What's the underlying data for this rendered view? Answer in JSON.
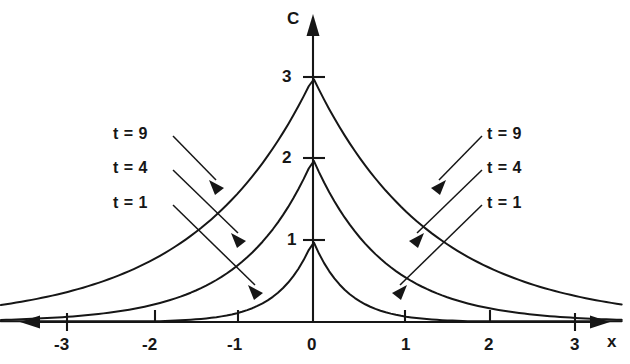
{
  "chart_data": {
    "type": "line",
    "title": "",
    "xlabel": "x",
    "ylabel": "C",
    "xlim": [
      -3.6,
      3.6
    ],
    "ylim": [
      0,
      3.6
    ],
    "grid": false,
    "legend_position": "inline-annotations",
    "x_ticks": [
      -3,
      -2,
      -1,
      0,
      1,
      2,
      3
    ],
    "x_tick_labels": [
      "-3",
      "-2",
      "-1",
      "0",
      "1",
      "2",
      "3"
    ],
    "y_ticks": [
      1,
      2,
      3
    ],
    "y_tick_labels": [
      "1",
      "2",
      "3"
    ],
    "series": [
      {
        "name": "t = 1",
        "peak": 1,
        "decay": 2.5,
        "x": [
          -3.6,
          -3.2,
          -2.8,
          -2.4,
          -2.0,
          -1.8,
          -1.6,
          -1.4,
          -1.2,
          -1.0,
          -0.8,
          -0.6,
          -0.4,
          -0.2,
          -0.05,
          0,
          0.05,
          0.2,
          0.4,
          0.6,
          0.8,
          1.0,
          1.2,
          1.4,
          1.6,
          1.8,
          2.0,
          2.4,
          2.8,
          3.2,
          3.6
        ],
        "values": [
          0.0,
          0.0,
          0.0,
          0.0,
          0.01,
          0.01,
          0.02,
          0.03,
          0.05,
          0.08,
          0.14,
          0.22,
          0.37,
          0.61,
          0.88,
          1.0,
          0.88,
          0.61,
          0.37,
          0.22,
          0.14,
          0.08,
          0.05,
          0.03,
          0.02,
          0.01,
          0.01,
          0.0,
          0.0,
          0.0,
          0.0
        ]
      },
      {
        "name": "t = 4",
        "peak": 2,
        "decay": 1.2,
        "x": [
          -3.6,
          -3.2,
          -2.8,
          -2.4,
          -2.0,
          -1.6,
          -1.2,
          -0.8,
          -0.4,
          -0.1,
          0,
          0.1,
          0.4,
          0.8,
          1.2,
          1.6,
          2.0,
          2.4,
          2.8,
          3.2,
          3.6
        ],
        "values": [
          0.03,
          0.04,
          0.07,
          0.11,
          0.18,
          0.29,
          0.47,
          0.77,
          1.24,
          1.77,
          2.0,
          1.77,
          1.24,
          0.77,
          0.47,
          0.29,
          0.18,
          0.11,
          0.07,
          0.04,
          0.03
        ]
      },
      {
        "name": "t = 9",
        "peak": 3,
        "decay": 0.73,
        "x": [
          -3.6,
          -3.2,
          -2.8,
          -2.4,
          -2.0,
          -1.6,
          -1.2,
          -0.8,
          -0.4,
          -0.1,
          0,
          0.1,
          0.4,
          0.8,
          1.2,
          1.6,
          2.0,
          2.4,
          2.8,
          3.2,
          3.6
        ],
        "values": [
          0.22,
          0.29,
          0.39,
          0.52,
          0.7,
          0.93,
          1.25,
          1.67,
          2.24,
          2.79,
          3.0,
          2.79,
          2.24,
          1.67,
          1.25,
          0.93,
          0.7,
          0.52,
          0.39,
          0.29,
          0.22
        ]
      }
    ],
    "annotations": [
      {
        "text": "t = 9",
        "side": "left"
      },
      {
        "text": "t = 4",
        "side": "left"
      },
      {
        "text": "t = 1",
        "side": "left"
      },
      {
        "text": "t = 9",
        "side": "right"
      },
      {
        "text": "t = 4",
        "side": "right"
      },
      {
        "text": "t = 1",
        "side": "right"
      }
    ]
  },
  "axes": {
    "y_axis_name": "C",
    "x_axis_name": "x"
  },
  "labels": {
    "y_3": "3",
    "y_2": "2",
    "y_1": "1",
    "x_neg3": "-3",
    "x_neg2": "-2",
    "x_neg1": "-1",
    "x_0": "0",
    "x_1": "1",
    "x_2": "2",
    "x_3": "3",
    "left_t9": "t = 9",
    "left_t4": "t = 4",
    "left_t1": "t = 1",
    "right_t9": "t = 9",
    "right_t4": "t = 4",
    "right_t1": "t = 1"
  },
  "colors": {
    "ink": "#161616",
    "background": "#ffffff"
  }
}
